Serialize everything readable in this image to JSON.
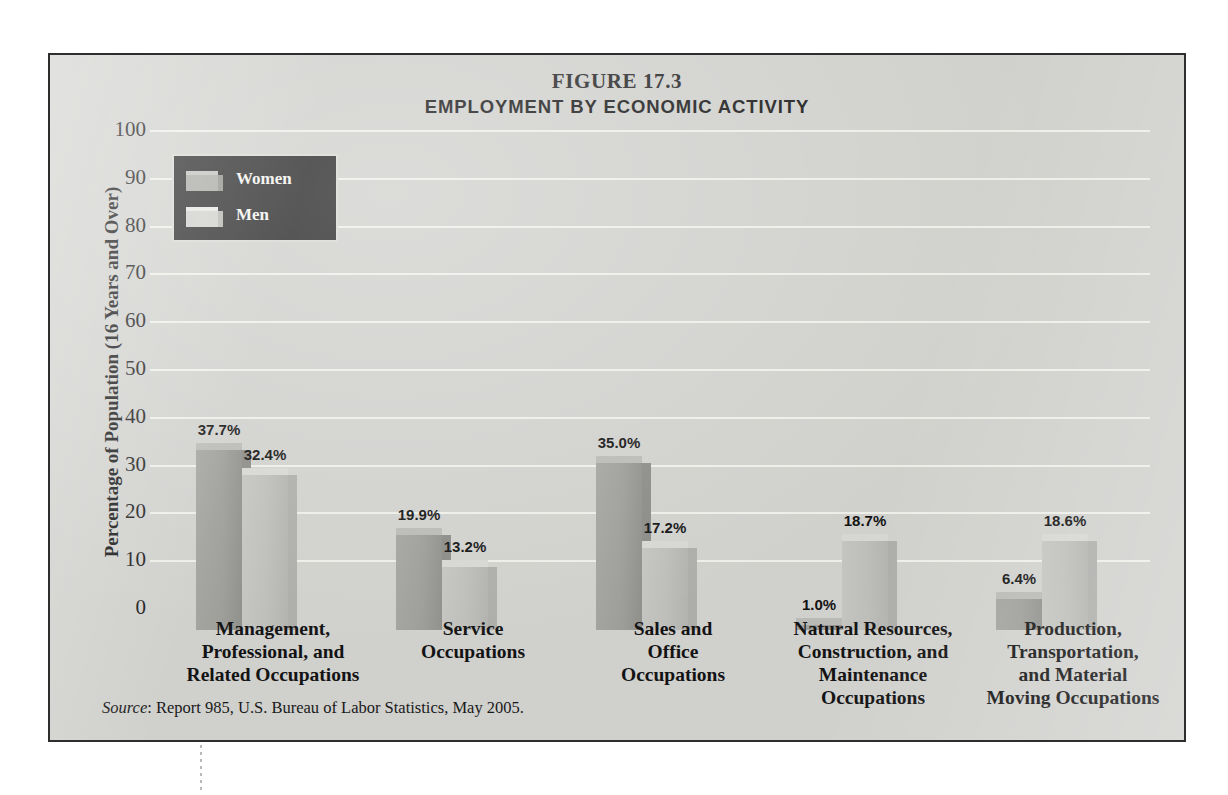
{
  "figure": {
    "number": "FIGURE 17.3",
    "title": "EMPLOYMENT BY ECONOMIC ACTIVITY",
    "source_word": "Source",
    "source_rest": ": Report 985, U.S. Bureau of Labor Statistics, May 2005."
  },
  "legend": {
    "items": [
      {
        "label": "Women",
        "color": "#9d9d99"
      },
      {
        "label": "Men",
        "color": "#bdbdb9"
      }
    ]
  },
  "chart_data": {
    "type": "bar",
    "title": "EMPLOYMENT BY ECONOMIC ACTIVITY",
    "subtitle": "FIGURE 17.3",
    "xlabel": "",
    "ylabel": "Percentage of Population (16 Years and Over)",
    "ylim": [
      0,
      100
    ],
    "ytick_labels": [
      "100",
      "90",
      "80",
      "70",
      "60",
      "50",
      "40",
      "30",
      "20",
      "10",
      "0"
    ],
    "ytick_values": [
      100,
      90,
      80,
      70,
      60,
      50,
      40,
      30,
      20,
      10,
      0
    ],
    "grid": true,
    "legend_position": "top-left",
    "categories": [
      "Management,\nProfessional, and\nRelated Occupations",
      "Service\nOccupations",
      "Sales and\nOffice\nOccupations",
      "Natural Resources,\nConstruction, and\nMaintenance\nOccupations",
      "Production,\nTransportation,\nand Material\nMoving Occupations"
    ],
    "category_lines": [
      [
        "Management,",
        "Professional, and",
        "Related Occupations"
      ],
      [
        "Service",
        "Occupations"
      ],
      [
        "Sales and",
        "Office",
        "Occupations"
      ],
      [
        "Natural Resources,",
        "Construction, and",
        "Maintenance",
        "Occupations"
      ],
      [
        "Production,",
        "Transportation,",
        "and Material",
        "Moving Occupations"
      ]
    ],
    "series": [
      {
        "name": "Women",
        "color": "#9d9d99",
        "values": [
          37.7,
          19.9,
          35.0,
          1.0,
          6.4
        ],
        "labels": [
          "37.7%",
          "19.9%",
          "35.0%",
          "1.0%",
          "6.4%"
        ]
      },
      {
        "name": "Men",
        "color": "#bdbdb9",
        "values": [
          32.4,
          13.2,
          17.2,
          18.7,
          18.6
        ],
        "labels": [
          "32.4%",
          "13.2%",
          "17.2%",
          "18.7%",
          "18.6%"
        ]
      }
    ]
  }
}
